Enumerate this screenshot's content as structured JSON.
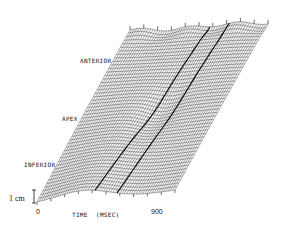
{
  "chart_data": {
    "type": "surface-wireframe",
    "title": "",
    "xlabel": "TIME (MSEC)",
    "x_ticks": [
      "0",
      "900"
    ],
    "xlim": [
      0,
      900
    ],
    "y_axis_labels": [
      "INFERIOR",
      "APEX",
      "ANTERIOR"
    ],
    "z_scale_bar": "1 cm",
    "surface_corners_px": {
      "bottom_left": [
        37,
        203
      ],
      "top_left": [
        130,
        30
      ],
      "top_right": [
        268,
        23
      ],
      "bottom_right": [
        175,
        190
      ]
    },
    "grid": true,
    "legend": null
  },
  "labels": {
    "anterior": "ANTERIOR",
    "apex": "APEX",
    "inferior": "INFERIOR",
    "scale": "1 cm",
    "x_start": "0",
    "x_end": "900",
    "x_title": "TIME",
    "x_unit": "(MSEC)"
  },
  "colors": {
    "ink": "#111111",
    "background": "#ffffff"
  }
}
